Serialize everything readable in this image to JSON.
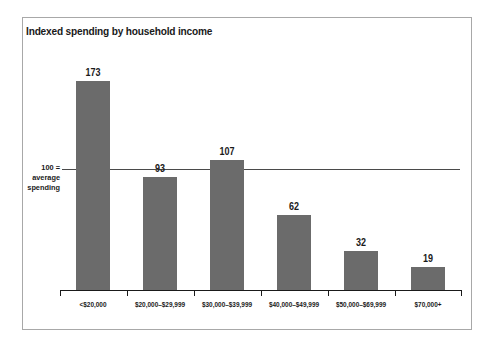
{
  "chart_data": {
    "type": "bar",
    "title": "Indexed spending by household income",
    "xlabel": "",
    "ylabel": "",
    "grid": false,
    "legend": "none",
    "ylim": [
      0,
      190
    ],
    "categories": [
      "<$20,000",
      "$20,000–$29,999",
      "$30,000–$39,999",
      "$40,000–$49,999",
      "$50,000–$69,999",
      "$70,000+"
    ],
    "values": [
      173,
      93,
      107,
      62,
      32,
      19
    ],
    "value_labels": [
      "173",
      "93",
      "107",
      "62",
      "32",
      "19"
    ],
    "reference_line": {
      "value": 100,
      "label_lines": [
        "100 =",
        "average",
        "spending"
      ]
    },
    "colors": {
      "bar_fill": "#6b6b6b",
      "axis": "#1a1a1a",
      "reference_line": "#4a4a4a",
      "frame_border": "#a8a8a8",
      "text": "#1a1a1a",
      "background": "#ffffff"
    }
  }
}
